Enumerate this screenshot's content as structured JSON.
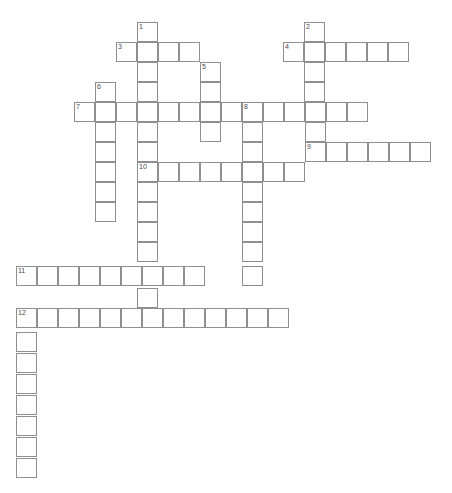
{
  "page": {
    "type": "crossword-puzzle-grid",
    "width": 452,
    "height": 493,
    "background_color": "#ffffff",
    "grid_line_color": "#8e8e93",
    "cell_fill_color": "#ffffff",
    "number_color": "#4a4a4f",
    "top_text_strip": "",
    "cell_width": 21,
    "cell_height": 20,
    "origin_x": 16,
    "origin_y": 22
  },
  "clue_numbers": [
    "1",
    "2",
    "3",
    "4",
    "5",
    "6",
    "7",
    "8",
    "9",
    "10",
    "11",
    "12"
  ],
  "entries": [
    {
      "number": "1",
      "direction": "down",
      "col": 6,
      "row": 0,
      "length": 15
    },
    {
      "number": "2",
      "direction": "down",
      "col": 14,
      "row": 0,
      "length": 8
    },
    {
      "number": "3",
      "direction": "across",
      "col": 5,
      "row": 1,
      "length": 4
    },
    {
      "number": "4",
      "direction": "across",
      "col": 13,
      "row": 1,
      "length": 6
    },
    {
      "number": "5",
      "direction": "down",
      "col": 9,
      "row": 2,
      "length": 4
    },
    {
      "number": "6",
      "direction": "down",
      "col": 4,
      "row": 3,
      "length": 7
    },
    {
      "number": "7",
      "direction": "across",
      "col": 3,
      "row": 4,
      "length": 8
    },
    {
      "number": "8",
      "direction": "across",
      "col": 11,
      "row": 4,
      "length": 6
    },
    {
      "number": "8",
      "direction": "down",
      "col": 11,
      "row": 4,
      "length": 10
    },
    {
      "number": "9",
      "direction": "across",
      "col": 14,
      "row": 6,
      "length": 6
    },
    {
      "number": "10",
      "direction": "across",
      "col": 6,
      "row": 7,
      "length": 8
    },
    {
      "number": "11",
      "direction": "across",
      "col": 0,
      "row": 12,
      "length": 9
    },
    {
      "number": "12",
      "direction": "across",
      "col": 0,
      "row": 14,
      "length": 14
    },
    {
      "number": "12",
      "direction": "down",
      "col": 0,
      "row": 14,
      "length": 8
    }
  ],
  "cells": [
    {
      "x": 137,
      "y": 22,
      "num": "1"
    },
    {
      "x": 304,
      "y": 22,
      "num": "2"
    },
    {
      "x": 116,
      "y": 42,
      "num": "3"
    },
    {
      "x": 137,
      "y": 42,
      "num": ""
    },
    {
      "x": 158,
      "y": 42,
      "num": ""
    },
    {
      "x": 179,
      "y": 42,
      "num": ""
    },
    {
      "x": 283,
      "y": 42,
      "num": "4"
    },
    {
      "x": 304,
      "y": 42,
      "num": ""
    },
    {
      "x": 325,
      "y": 42,
      "num": ""
    },
    {
      "x": 346,
      "y": 42,
      "num": ""
    },
    {
      "x": 367,
      "y": 42,
      "num": ""
    },
    {
      "x": 388,
      "y": 42,
      "num": ""
    },
    {
      "x": 137,
      "y": 62,
      "num": ""
    },
    {
      "x": 200,
      "y": 62,
      "num": "5"
    },
    {
      "x": 304,
      "y": 62,
      "num": ""
    },
    {
      "x": 95,
      "y": 82,
      "num": "6"
    },
    {
      "x": 137,
      "y": 82,
      "num": ""
    },
    {
      "x": 200,
      "y": 82,
      "num": ""
    },
    {
      "x": 304,
      "y": 82,
      "num": ""
    },
    {
      "x": 74,
      "y": 102,
      "num": "7"
    },
    {
      "x": 95,
      "y": 102,
      "num": ""
    },
    {
      "x": 116,
      "y": 102,
      "num": ""
    },
    {
      "x": 137,
      "y": 102,
      "num": ""
    },
    {
      "x": 158,
      "y": 102,
      "num": ""
    },
    {
      "x": 179,
      "y": 102,
      "num": ""
    },
    {
      "x": 200,
      "y": 102,
      "num": ""
    },
    {
      "x": 221,
      "y": 102,
      "num": ""
    },
    {
      "x": 242,
      "y": 102,
      "num": "8"
    },
    {
      "x": 263,
      "y": 102,
      "num": ""
    },
    {
      "x": 284,
      "y": 102,
      "num": ""
    },
    {
      "x": 305,
      "y": 102,
      "num": ""
    },
    {
      "x": 326,
      "y": 102,
      "num": ""
    },
    {
      "x": 347,
      "y": 102,
      "num": ""
    },
    {
      "x": 95,
      "y": 122,
      "num": ""
    },
    {
      "x": 137,
      "y": 122,
      "num": ""
    },
    {
      "x": 200,
      "y": 122,
      "num": ""
    },
    {
      "x": 242,
      "y": 122,
      "num": ""
    },
    {
      "x": 305,
      "y": 122,
      "num": ""
    },
    {
      "x": 95,
      "y": 142,
      "num": ""
    },
    {
      "x": 137,
      "y": 142,
      "num": ""
    },
    {
      "x": 242,
      "y": 142,
      "num": ""
    },
    {
      "x": 305,
      "y": 142,
      "num": "9"
    },
    {
      "x": 326,
      "y": 142,
      "num": ""
    },
    {
      "x": 347,
      "y": 142,
      "num": ""
    },
    {
      "x": 368,
      "y": 142,
      "num": ""
    },
    {
      "x": 389,
      "y": 142,
      "num": ""
    },
    {
      "x": 410,
      "y": 142,
      "num": ""
    },
    {
      "x": 95,
      "y": 162,
      "num": ""
    },
    {
      "x": 137,
      "y": 162,
      "num": "10"
    },
    {
      "x": 158,
      "y": 162,
      "num": ""
    },
    {
      "x": 179,
      "y": 162,
      "num": ""
    },
    {
      "x": 200,
      "y": 162,
      "num": ""
    },
    {
      "x": 221,
      "y": 162,
      "num": ""
    },
    {
      "x": 242,
      "y": 162,
      "num": ""
    },
    {
      "x": 263,
      "y": 162,
      "num": ""
    },
    {
      "x": 284,
      "y": 162,
      "num": ""
    },
    {
      "x": 95,
      "y": 182,
      "num": ""
    },
    {
      "x": 137,
      "y": 182,
      "num": ""
    },
    {
      "x": 242,
      "y": 182,
      "num": ""
    },
    {
      "x": 95,
      "y": 202,
      "num": ""
    },
    {
      "x": 137,
      "y": 202,
      "num": ""
    },
    {
      "x": 242,
      "y": 202,
      "num": ""
    },
    {
      "x": 137,
      "y": 222,
      "num": ""
    },
    {
      "x": 242,
      "y": 222,
      "num": ""
    },
    {
      "x": 137,
      "y": 242,
      "num": ""
    },
    {
      "x": 242,
      "y": 242,
      "num": ""
    },
    {
      "x": 16,
      "y": 266,
      "num": "11"
    },
    {
      "x": 37,
      "y": 266,
      "num": ""
    },
    {
      "x": 58,
      "y": 266,
      "num": ""
    },
    {
      "x": 79,
      "y": 266,
      "num": ""
    },
    {
      "x": 100,
      "y": 266,
      "num": ""
    },
    {
      "x": 121,
      "y": 266,
      "num": ""
    },
    {
      "x": 142,
      "y": 266,
      "num": ""
    },
    {
      "x": 163,
      "y": 266,
      "num": ""
    },
    {
      "x": 184,
      "y": 266,
      "num": ""
    },
    {
      "x": 242,
      "y": 266,
      "num": ""
    },
    {
      "x": 137,
      "y": 288,
      "num": ""
    },
    {
      "x": 16,
      "y": 308,
      "num": "12"
    },
    {
      "x": 37,
      "y": 308,
      "num": ""
    },
    {
      "x": 58,
      "y": 308,
      "num": ""
    },
    {
      "x": 79,
      "y": 308,
      "num": ""
    },
    {
      "x": 100,
      "y": 308,
      "num": ""
    },
    {
      "x": 121,
      "y": 308,
      "num": ""
    },
    {
      "x": 142,
      "y": 308,
      "num": ""
    },
    {
      "x": 163,
      "y": 308,
      "num": ""
    },
    {
      "x": 184,
      "y": 308,
      "num": ""
    },
    {
      "x": 205,
      "y": 308,
      "num": ""
    },
    {
      "x": 226,
      "y": 308,
      "num": ""
    },
    {
      "x": 247,
      "y": 308,
      "num": ""
    },
    {
      "x": 268,
      "y": 308,
      "num": ""
    },
    {
      "x": 16,
      "y": 332,
      "num": ""
    },
    {
      "x": 16,
      "y": 353,
      "num": ""
    },
    {
      "x": 16,
      "y": 374,
      "num": ""
    },
    {
      "x": 16,
      "y": 395,
      "num": ""
    },
    {
      "x": 16,
      "y": 416,
      "num": ""
    },
    {
      "x": 16,
      "y": 437,
      "num": ""
    },
    {
      "x": 16,
      "y": 458,
      "num": ""
    }
  ]
}
